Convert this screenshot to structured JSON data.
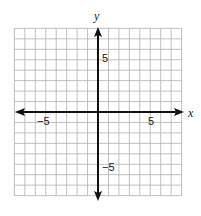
{
  "diagram": {
    "type": "coordinate-plane",
    "x_axis": {
      "label": "x",
      "min": -8,
      "max": 8,
      "tick_labels": [
        {
          "value": -5,
          "text": "−5"
        },
        {
          "value": 5,
          "text": "5"
        }
      ]
    },
    "y_axis": {
      "label": "y",
      "min": -8,
      "max": 8,
      "tick_labels": [
        {
          "value": 5,
          "text": "5"
        },
        {
          "value": -5,
          "text": "−5"
        }
      ]
    },
    "grid": {
      "step": 1,
      "color": "#b0b0b0",
      "minor_color": "#d0d0d0"
    },
    "axis_color": "#111111"
  }
}
